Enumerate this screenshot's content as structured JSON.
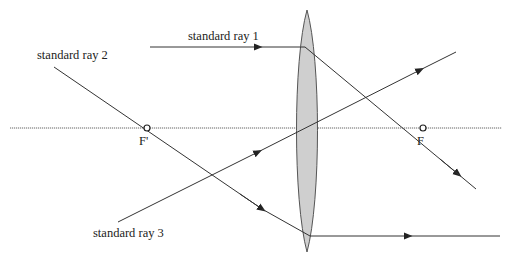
{
  "diagram": {
    "colors": {
      "ray": "#333333",
      "lens_fill": "#cfcfcf",
      "lens_stroke": "#555555",
      "axis": "#666666"
    },
    "labels": {
      "ray1": "standard ray 1",
      "ray2": "standard ray 2",
      "ray3": "standard ray 3",
      "focal_front": "F'",
      "focal_back": "F"
    },
    "elements": {
      "optical_axis": {
        "y": 128,
        "x1": 10,
        "x2": 502
      },
      "lens": {
        "cx": 307,
        "top": 10,
        "bottom": 252,
        "half_width": 10
      },
      "focal_points": [
        {
          "name": "F'",
          "x": 147,
          "y": 128
        },
        {
          "name": "F",
          "x": 423,
          "y": 128
        }
      ]
    }
  }
}
